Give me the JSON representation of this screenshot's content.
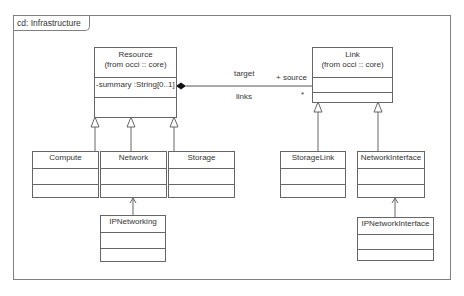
{
  "diagram": {
    "frame_label": "cd: Infrastructure",
    "classes": {
      "resource": {
        "name": "Resource",
        "stereo": "(from occi :: core)",
        "attributes": [
          "-summary :String[0..1]"
        ]
      },
      "link": {
        "name": "Link",
        "stereo": "(from occi :: core)",
        "attributes": []
      },
      "compute": {
        "name": "Compute"
      },
      "network": {
        "name": "Network"
      },
      "storage": {
        "name": "Storage"
      },
      "storagelink": {
        "name": "StorageLink"
      },
      "networkinterface": {
        "name": "NetworkInterface"
      },
      "ipnetworking": {
        "name": "IPNetworking"
      },
      "ipnetworkinterface": {
        "name": "IPNetworkInterface"
      }
    },
    "association": {
      "label_target": "target",
      "label_links": "links",
      "label_source": "+ source",
      "multiplicity": "*"
    },
    "colors": {
      "line": "#666666",
      "frame": "#808080",
      "text": "#333333"
    }
  }
}
